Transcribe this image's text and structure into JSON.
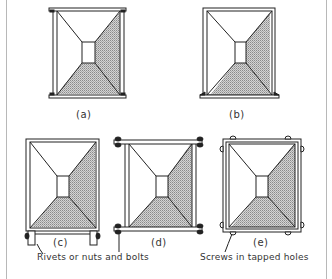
{
  "figure": {
    "panels": [
      {
        "id": "a",
        "label": "(a)",
        "description": "Tapered duct (rectangular frame with top and bottom flanges)"
      },
      {
        "id": "b",
        "label": "(b)",
        "description": "Tapered duct with flanges on bottom only"
      },
      {
        "id": "c",
        "label": "(c)",
        "description": "Duct with turned-down lugs at bottom secured by rivets"
      },
      {
        "id": "d",
        "label": "(d)",
        "description": "Duct with flanges top and bottom secured by nuts and bolts"
      },
      {
        "id": "e",
        "label": "(e)",
        "description": "Duct with surrounding angle frame secured by screws"
      }
    ],
    "annotations": {
      "rivets": "Rivets or nuts and bolts",
      "screws": "Screws in tapped holes"
    },
    "colors": {
      "line": "#222222",
      "shade": "#9a9a9a",
      "frame": "#b8b8b8"
    }
  }
}
